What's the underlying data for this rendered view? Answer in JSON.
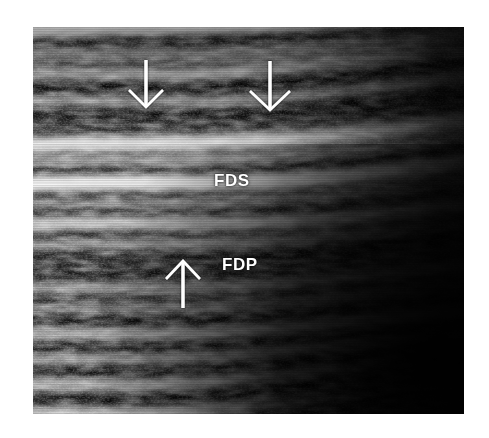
{
  "figure": {
    "modality": "ultrasound",
    "view": "longitudinal",
    "background_color": "#ffffff",
    "panel": {
      "x": 33,
      "y": 27,
      "width": 431,
      "height": 387,
      "fill_color": "#000000"
    }
  },
  "annotations": {
    "labels": [
      {
        "id": "fds",
        "text": "FDS",
        "x": 181,
        "y": 145,
        "color": "#ffffff",
        "meaning": "flexor-digitorum-superficialis-tendon"
      },
      {
        "id": "fdp",
        "text": "FDP",
        "x": 189,
        "y": 229,
        "color": "#ffffff",
        "meaning": "flexor-digitorum-profundus-tendon"
      }
    ],
    "arrows": [
      {
        "id": "arrow-down-left",
        "direction": "down",
        "tip_x": 113,
        "tip_y": 79,
        "tail_x": 113,
        "tail_y": 33,
        "head_half_width": 17,
        "head_length": 18,
        "color": "#ffffff"
      },
      {
        "id": "arrow-down-right",
        "direction": "down",
        "tip_x": 237,
        "tip_y": 82,
        "tail_x": 237,
        "tail_y": 34,
        "head_half_width": 20,
        "head_length": 19,
        "color": "#ffffff"
      },
      {
        "id": "arrow-up-center",
        "direction": "up",
        "tip_x": 150,
        "tip_y": 235,
        "tail_x": 150,
        "tail_y": 281,
        "head_half_width": 17,
        "head_length": 18,
        "color": "#ffffff"
      }
    ]
  }
}
